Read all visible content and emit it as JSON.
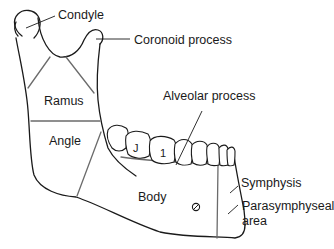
{
  "diagram": {
    "labels": {
      "condyle": "Condyle",
      "coronoid_process": "Coronoid process",
      "ramus": "Ramus",
      "alveolar_process": "Alveolar process",
      "angle": "Angle",
      "body": "Body",
      "symphysis": "Symphysis",
      "parasymphyseal_line1": "Parasymphyseal",
      "parasymphyseal_line2": "area"
    },
    "tooth_marks": {
      "first": "J",
      "second": "1"
    },
    "colors": {
      "outline": "#1a1a1a",
      "region_lines": "#6b6b6b",
      "background": "#ffffff"
    }
  }
}
